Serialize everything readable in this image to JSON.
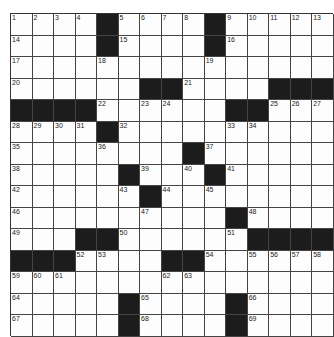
{
  "puzzle": {
    "size": 15,
    "colors": {
      "black": "#1c1c1c",
      "white": "#fdfdfd",
      "line": "#444444"
    },
    "grid": [
      "....#....#.....",
      "....#....#.....",
      "...............",
      "......##....###",
      "####......##...",
      "....#..........",
      "........#......",
      ".....#...#.....",
      "......#........",
      "..........#....",
      "...##......####",
      "###....##......",
      "...............",
      ".....#....#....",
      ".....#....#...."
    ],
    "numbers": [
      {
        "r": 0,
        "c": 0,
        "n": "1"
      },
      {
        "r": 0,
        "c": 1,
        "n": "2"
      },
      {
        "r": 0,
        "c": 2,
        "n": "3"
      },
      {
        "r": 0,
        "c": 3,
        "n": "4"
      },
      {
        "r": 0,
        "c": 5,
        "n": "5"
      },
      {
        "r": 0,
        "c": 6,
        "n": "6"
      },
      {
        "r": 0,
        "c": 7,
        "n": "7"
      },
      {
        "r": 0,
        "c": 8,
        "n": "8"
      },
      {
        "r": 0,
        "c": 10,
        "n": "9"
      },
      {
        "r": 0,
        "c": 11,
        "n": "10"
      },
      {
        "r": 0,
        "c": 12,
        "n": "11"
      },
      {
        "r": 0,
        "c": 13,
        "n": "12"
      },
      {
        "r": 0,
        "c": 14,
        "n": "13"
      },
      {
        "r": 1,
        "c": 0,
        "n": "14"
      },
      {
        "r": 1,
        "c": 5,
        "n": "15"
      },
      {
        "r": 1,
        "c": 10,
        "n": "16"
      },
      {
        "r": 2,
        "c": 0,
        "n": "17"
      },
      {
        "r": 2,
        "c": 4,
        "n": "18"
      },
      {
        "r": 2,
        "c": 9,
        "n": "19"
      },
      {
        "r": 3,
        "c": 0,
        "n": "20"
      },
      {
        "r": 3,
        "c": 8,
        "n": "21"
      },
      {
        "r": 4,
        "c": 4,
        "n": "22"
      },
      {
        "r": 4,
        "c": 6,
        "n": "23"
      },
      {
        "r": 4,
        "c": 7,
        "n": "24"
      },
      {
        "r": 4,
        "c": 12,
        "n": "25"
      },
      {
        "r": 4,
        "c": 13,
        "n": "26"
      },
      {
        "r": 4,
        "c": 14,
        "n": "27"
      },
      {
        "r": 5,
        "c": 0,
        "n": "28"
      },
      {
        "r": 5,
        "c": 1,
        "n": "29"
      },
      {
        "r": 5,
        "c": 2,
        "n": "30"
      },
      {
        "r": 5,
        "c": 3,
        "n": "31"
      },
      {
        "r": 5,
        "c": 5,
        "n": "32"
      },
      {
        "r": 5,
        "c": 10,
        "n": "33"
      },
      {
        "r": 5,
        "c": 11,
        "n": "34"
      },
      {
        "r": 6,
        "c": 0,
        "n": "35"
      },
      {
        "r": 6,
        "c": 4,
        "n": "36"
      },
      {
        "r": 6,
        "c": 9,
        "n": "37"
      },
      {
        "r": 7,
        "c": 0,
        "n": "38"
      },
      {
        "r": 7,
        "c": 6,
        "n": "39"
      },
      {
        "r": 7,
        "c": 8,
        "n": "40"
      },
      {
        "r": 7,
        "c": 10,
        "n": "41"
      },
      {
        "r": 8,
        "c": 0,
        "n": "42"
      },
      {
        "r": 8,
        "c": 5,
        "n": "43"
      },
      {
        "r": 8,
        "c": 7,
        "n": "44"
      },
      {
        "r": 8,
        "c": 9,
        "n": "45"
      },
      {
        "r": 9,
        "c": 0,
        "n": "46"
      },
      {
        "r": 9,
        "c": 6,
        "n": "47"
      },
      {
        "r": 9,
        "c": 11,
        "n": "48"
      },
      {
        "r": 10,
        "c": 0,
        "n": "49"
      },
      {
        "r": 10,
        "c": 5,
        "n": "50"
      },
      {
        "r": 10,
        "c": 10,
        "n": "51"
      },
      {
        "r": 11,
        "c": 3,
        "n": "52"
      },
      {
        "r": 11,
        "c": 4,
        "n": "53"
      },
      {
        "r": 11,
        "c": 9,
        "n": "54"
      },
      {
        "r": 11,
        "c": 11,
        "n": "55"
      },
      {
        "r": 11,
        "c": 12,
        "n": "56"
      },
      {
        "r": 11,
        "c": 13,
        "n": "57"
      },
      {
        "r": 11,
        "c": 14,
        "n": "58"
      },
      {
        "r": 12,
        "c": 0,
        "n": "59"
      },
      {
        "r": 12,
        "c": 1,
        "n": "60"
      },
      {
        "r": 12,
        "c": 2,
        "n": "61"
      },
      {
        "r": 12,
        "c": 7,
        "n": "62"
      },
      {
        "r": 12,
        "c": 8,
        "n": "63"
      },
      {
        "r": 13,
        "c": 0,
        "n": "64"
      },
      {
        "r": 13,
        "c": 6,
        "n": "65"
      },
      {
        "r": 13,
        "c": 11,
        "n": "66"
      },
      {
        "r": 14,
        "c": 0,
        "n": "67"
      },
      {
        "r": 14,
        "c": 6,
        "n": "68"
      },
      {
        "r": 14,
        "c": 11,
        "n": "69"
      }
    ]
  }
}
